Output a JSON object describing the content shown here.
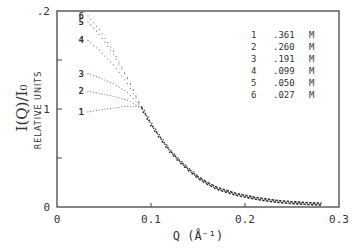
{
  "chart_data": {
    "type": "scatter",
    "title": "",
    "xlabel": "Q  (Å⁻¹)",
    "ylabel": "I(Q)/I₀",
    "ylabel_sub": "RELATIVE UNITS",
    "xlim": [
      0,
      0.3
    ],
    "ylim": [
      0,
      0.2
    ],
    "x_ticks": [
      {
        "value": 0,
        "label": "0"
      },
      {
        "value": 0.1,
        "label": "0.1"
      },
      {
        "value": 0.2,
        "label": "0.2"
      },
      {
        "value": 0.3,
        "label": "0.3"
      }
    ],
    "y_ticks": [
      {
        "value": 0,
        "label": "0"
      },
      {
        "value": 0.1,
        "label": ".1"
      },
      {
        "value": 0.2,
        "label": ".2"
      }
    ],
    "y_minor_ticks": [
      0.05,
      0.15
    ],
    "grid": false,
    "legend_position": "top-right",
    "legend": [
      {
        "id": "1",
        "conc": ".361",
        "unit": "M"
      },
      {
        "id": "2",
        "conc": ".260",
        "unit": "M"
      },
      {
        "id": "3",
        "conc": ".191",
        "unit": "M"
      },
      {
        "id": "4",
        "conc": ".099",
        "unit": "M"
      },
      {
        "id": "5",
        "conc": ".050",
        "unit": "M"
      },
      {
        "id": "6",
        "conc": ".027",
        "unit": "M"
      }
    ],
    "series": [
      {
        "name": "1",
        "label": "1",
        "x": [
          0.033,
          0.045,
          0.06,
          0.075,
          0.09
        ],
        "y": [
          0.097,
          0.099,
          0.101,
          0.103,
          0.102
        ]
      },
      {
        "name": "2",
        "label": "2",
        "x": [
          0.033,
          0.045,
          0.06,
          0.075,
          0.09
        ],
        "y": [
          0.118,
          0.116,
          0.113,
          0.109,
          0.101
        ]
      },
      {
        "name": "3",
        "label": "3",
        "x": [
          0.033,
          0.045,
          0.06,
          0.075,
          0.09
        ],
        "y": [
          0.136,
          0.132,
          0.126,
          0.117,
          0.101
        ]
      },
      {
        "name": "4",
        "label": "4",
        "x": [
          0.033,
          0.045,
          0.06,
          0.075,
          0.09
        ],
        "y": [
          0.17,
          0.16,
          0.145,
          0.126,
          0.101
        ]
      },
      {
        "name": "5",
        "label": "5",
        "x": [
          0.033,
          0.045,
          0.06,
          0.075,
          0.09
        ],
        "y": [
          0.189,
          0.176,
          0.156,
          0.131,
          0.101
        ]
      },
      {
        "name": "6",
        "label": "6",
        "x": [
          0.033,
          0.045,
          0.06,
          0.075,
          0.09
        ],
        "y": [
          0.195,
          0.181,
          0.159,
          0.132,
          0.101
        ]
      },
      {
        "name": "common",
        "label": "",
        "x": [
          0.09,
          0.1,
          0.11,
          0.12,
          0.13,
          0.14,
          0.15,
          0.16,
          0.17,
          0.18,
          0.19,
          0.2,
          0.21,
          0.22,
          0.23,
          0.24,
          0.25,
          0.26,
          0.27,
          0.28
        ],
        "y": [
          0.101,
          0.084,
          0.07,
          0.057,
          0.047,
          0.038,
          0.03,
          0.024,
          0.019,
          0.016,
          0.013,
          0.011,
          0.009,
          0.0075,
          0.0062,
          0.0052,
          0.0044,
          0.0038,
          0.0033,
          0.003
        ]
      }
    ]
  }
}
